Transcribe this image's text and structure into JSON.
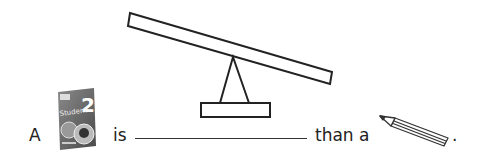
{
  "worksheet": {
    "sentence": {
      "article_1": "A",
      "object_1": "student-book",
      "object_1_cover_number": "2",
      "object_1_cover_title": "Student",
      "verb": "is",
      "blank_answer": "",
      "comparison": "than a",
      "object_2": "pencil",
      "end_punct": "."
    },
    "figure": {
      "type": "seesaw",
      "tilt": "left-side-up"
    }
  },
  "colors": {
    "ink": "#222222",
    "book_cover": "#6a6a6a",
    "background": "#ffffff"
  }
}
